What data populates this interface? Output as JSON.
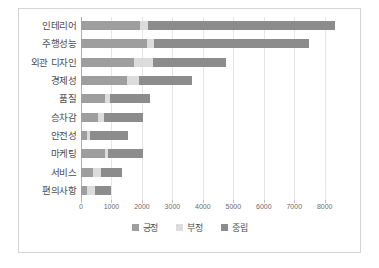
{
  "chart_data": {
    "type": "bar",
    "orientation": "horizontal",
    "stacked": true,
    "title": "",
    "xlabel": "",
    "ylabel": "",
    "xlim": [
      0,
      8600
    ],
    "xticks": [
      0,
      1000,
      2000,
      3000,
      4000,
      5000,
      6000,
      7000,
      8000
    ],
    "xtick_labels": [
      "0",
      "1000",
      "2000",
      "3000",
      "4000",
      "5000",
      "6000",
      "7000",
      "8000"
    ],
    "grid": true,
    "grid_axis": "x",
    "legend_position": "bottom-center",
    "categories": [
      "인테리어",
      "주행성능",
      "외관 디자인",
      "경제성",
      "품질",
      "승차감",
      "안전성",
      "마케팅",
      "서비스",
      "편의사항"
    ],
    "series": [
      {
        "name": "긍정",
        "color": "#9e9e9e",
        "values": [
          1950,
          2150,
          1750,
          1500,
          800,
          550,
          200,
          800,
          400,
          200
        ]
      },
      {
        "name": "부정",
        "color": "#dcdcdc",
        "values": [
          250,
          250,
          600,
          400,
          150,
          200,
          100,
          100,
          250,
          250
        ]
      },
      {
        "name": "중립",
        "color": "#8c8c8c",
        "values": [
          6150,
          5100,
          2400,
          1750,
          1300,
          1300,
          1250,
          1150,
          700,
          550
        ]
      }
    ],
    "totals": [
      8350,
      7500,
      4750,
      3650,
      2250,
      2050,
      1550,
      2050,
      1350,
      1000
    ]
  },
  "legend": {
    "items": [
      {
        "label": "긍정",
        "color": "#9e9e9e"
      },
      {
        "label": "부정",
        "color": "#dcdcdc"
      },
      {
        "label": "중립",
        "color": "#8c8c8c"
      }
    ]
  },
  "colors": {
    "frame_border": "#d4d4d4",
    "gridline": "#e6e6e6",
    "axis_line": "#b0b0b0",
    "label_text": "#4d4d4d",
    "tick_text": "#6b6b6b",
    "background": "#ffffff"
  }
}
